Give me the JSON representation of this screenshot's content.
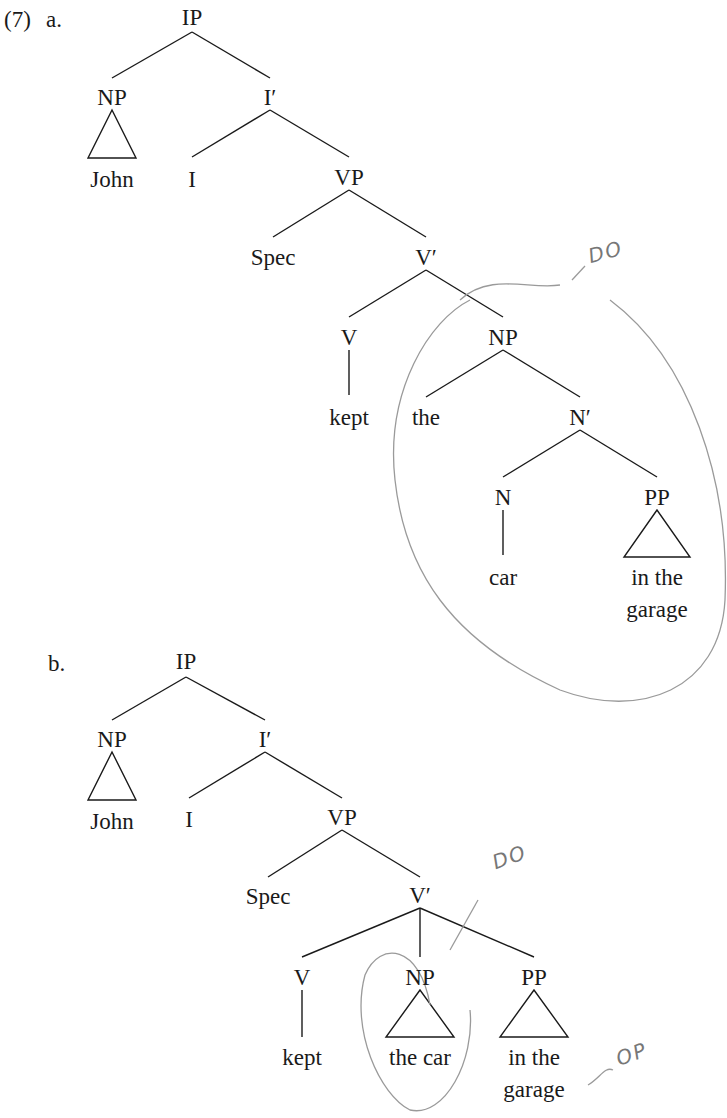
{
  "example_number": "(7)",
  "trees": [
    {
      "label": "a.",
      "nodes": {
        "IP": "IP",
        "NP_subj": "NP",
        "John": "John",
        "Ibar": "I′",
        "I": "I",
        "VP": "VP",
        "Spec": "Spec",
        "Vbar": "V′",
        "V": "V",
        "kept": "kept",
        "NP_obj": "NP",
        "the": "the",
        "Nbar": "N′",
        "N": "N",
        "car": "car",
        "PP": "PP",
        "pp_line1": "in the",
        "pp_line2": "garage"
      },
      "annotations": {
        "do": "DO"
      }
    },
    {
      "label": "b.",
      "nodes": {
        "IP": "IP",
        "NP_subj": "NP",
        "John": "John",
        "Ibar": "I′",
        "I": "I",
        "VP": "VP",
        "Spec": "Spec",
        "Vbar": "V′",
        "V": "V",
        "kept": "kept",
        "NP_obj": "NP",
        "np_obj_text": "the car",
        "PP": "PP",
        "pp_line1": "in the",
        "pp_line2": "garage"
      },
      "annotations": {
        "do": "DO",
        "op": "OP"
      }
    }
  ]
}
